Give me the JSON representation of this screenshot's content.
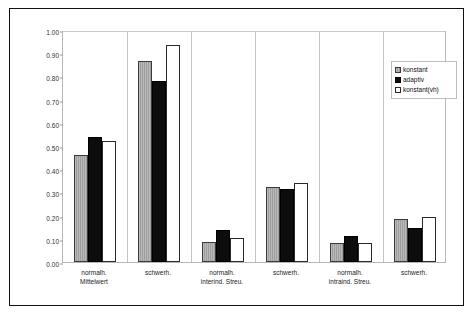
{
  "chart_data": {
    "type": "bar",
    "title": "",
    "xlabel": "",
    "ylabel": "Steigung [cu/dB]",
    "ylim": [
      0.0,
      1.0
    ],
    "ytick_step": 0.1,
    "ytick_labels": [
      "0.00",
      "0.10",
      "0.20",
      "0.30",
      "0.40",
      "0.50",
      "0.60",
      "0.70",
      "0.80",
      "0.90",
      "1.00"
    ],
    "grid": false,
    "legend_position": "top-right",
    "categories": [
      {
        "line1": "normalh.",
        "line2": "Mittelwert"
      },
      {
        "line1": "schwerh.",
        "line2": ""
      },
      {
        "line1": "normalh.",
        "line2": "interind. Streu."
      },
      {
        "line1": "schwerh.",
        "line2": ""
      },
      {
        "line1": "normalh.",
        "line2": "intraind. Streu."
      },
      {
        "line1": "schwerh.",
        "line2": ""
      }
    ],
    "series": [
      {
        "name": "konstant",
        "key": "konstant",
        "color": "#9d9d9d",
        "values": [
          0.46,
          0.865,
          0.085,
          0.325,
          0.08,
          0.185
        ]
      },
      {
        "name": "adaptiv",
        "key": "adaptiv",
        "color": "#0d0d0d",
        "values": [
          0.54,
          0.78,
          0.14,
          0.315,
          0.11,
          0.145
        ]
      },
      {
        "name": "konstant(vh)",
        "key": "konstantvh",
        "color": "#ffffff",
        "values": [
          0.52,
          0.935,
          0.105,
          0.34,
          0.08,
          0.195
        ]
      }
    ]
  },
  "legend": {
    "items": [
      {
        "label": "konstant"
      },
      {
        "label": "adaptiv"
      },
      {
        "label": "konstant(vh)"
      }
    ]
  }
}
